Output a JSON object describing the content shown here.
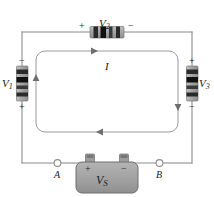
{
  "figure": {
    "background_color": "#ffffff",
    "wire_color": "#8c8c8c",
    "component_body_color": "#a8a8a8",
    "component_band_color": "#1a1a1a",
    "battery_body_color": "#a0a0a0",
    "label_color": "#1a1a1a"
  },
  "components": {
    "top": {
      "name": "V2",
      "label": "V",
      "subscript": "2",
      "orientation": "horizontal",
      "plus_sign": "+",
      "minus_sign": "−",
      "plus_position": "left",
      "minus_position": "right"
    },
    "left": {
      "name": "V1",
      "label": "V",
      "subscript": "1",
      "orientation": "vertical",
      "plus_sign": "+",
      "minus_sign": "−",
      "plus_position": "bottom",
      "minus_position": "top"
    },
    "right": {
      "name": "V3",
      "label": "V",
      "subscript": "3",
      "orientation": "vertical",
      "plus_sign": "+",
      "minus_sign": "−",
      "plus_position": "top",
      "minus_position": "bottom"
    },
    "source": {
      "name": "VS",
      "label": "V",
      "subscript": "S",
      "plus_sign": "+",
      "minus_sign": "−",
      "plus_position": "left-terminal",
      "minus_position": "right-terminal"
    }
  },
  "nodes": [
    {
      "name": "A",
      "label": "A",
      "side": "left"
    },
    {
      "name": "B",
      "label": "B",
      "side": "right"
    }
  ],
  "current": {
    "label": "I",
    "direction": "clockwise",
    "arrows": [
      "top-right",
      "right-down",
      "bottom-left",
      "left-up"
    ]
  }
}
